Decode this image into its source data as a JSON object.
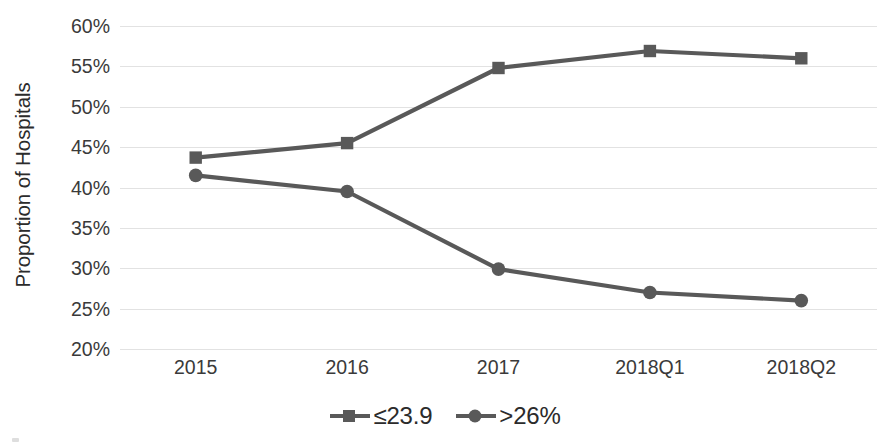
{
  "chart_data": {
    "type": "line",
    "title": "",
    "subtitle": "",
    "xlabel": "",
    "ylabel": "Proportion of Hospitals",
    "categories": [
      "2015",
      "2016",
      "2017",
      "2018Q1",
      "2018Q2"
    ],
    "ylim": [
      20,
      60
    ],
    "ytick_step": 5,
    "ytick_labels": [
      "60%",
      "55%",
      "50%",
      "45%",
      "40%",
      "35%",
      "30%",
      "25%",
      "20%"
    ],
    "ytick_values": [
      60,
      55,
      50,
      45,
      40,
      35,
      30,
      25,
      20
    ],
    "grid": "horizontal",
    "legend_position": "bottom-center",
    "series": [
      {
        "name": "≤23.9",
        "marker": "square",
        "color": "#595959",
        "values": [
          43.7,
          45.5,
          54.8,
          56.9,
          56.0
        ]
      },
      {
        "name": ">26%",
        "marker": "circle",
        "color": "#595959",
        "values": [
          41.5,
          39.5,
          29.9,
          27.0,
          26.0
        ]
      }
    ],
    "annotations": []
  },
  "colors": {
    "series_line": "#595959",
    "gridline": "#e2e2e2",
    "axis_text": "#3a3a3a",
    "title_text": "#2b2b2b",
    "background": "#ffffff"
  },
  "legend": {
    "entries": [
      {
        "label": "≤23.9",
        "marker": "square-marker-icon"
      },
      {
        "label": ">26%",
        "marker": "circle-marker-icon"
      }
    ]
  }
}
